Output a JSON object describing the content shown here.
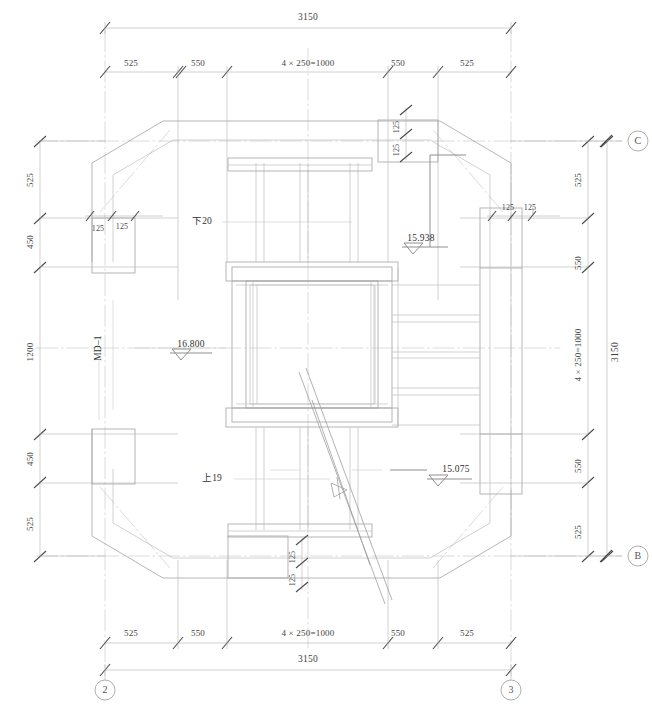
{
  "drawing": {
    "type": "structural-plan",
    "title": "",
    "units": "mm",
    "background": "#ffffff",
    "line_color": "#b9b9b9",
    "heavy_line_color": "#8f8f8f",
    "text_color": "#3b3b3b"
  },
  "grid_bubbles": [
    {
      "id": "bubble-c",
      "label": "C",
      "x": 638,
      "y": 141
    },
    {
      "id": "bubble-b",
      "label": "B",
      "x": 638,
      "y": 556
    },
    {
      "id": "bubble-2",
      "label": "2",
      "x": 105,
      "y": 690
    },
    {
      "id": "bubble-3",
      "label": "3",
      "x": 511,
      "y": 690
    }
  ],
  "dimensions": {
    "top_overall": {
      "text": "3150",
      "x": 308,
      "y": 18
    },
    "top_chain": [
      {
        "text": "525",
        "x": 131,
        "y": 63
      },
      {
        "text": "550",
        "x": 198,
        "y": 63
      },
      {
        "text": "4 × 250=1000",
        "x": 308,
        "y": 63
      },
      {
        "text": "550",
        "x": 398,
        "y": 63
      },
      {
        "text": "525",
        "x": 467,
        "y": 63
      }
    ],
    "bottom_chain": [
      {
        "text": "525",
        "x": 131,
        "y": 633
      },
      {
        "text": "550",
        "x": 198,
        "y": 633
      },
      {
        "text": "4 × 250=1000",
        "x": 308,
        "y": 633
      },
      {
        "text": "550",
        "x": 398,
        "y": 633
      },
      {
        "text": "525",
        "x": 467,
        "y": 633
      }
    ],
    "bottom_overall": {
      "text": "3150",
      "x": 308,
      "y": 660
    },
    "left_chain": [
      {
        "text": "525",
        "x": 30,
        "y": 180
      },
      {
        "text": "450",
        "x": 30,
        "y": 240
      },
      {
        "text": "1200",
        "x": 30,
        "y": 348
      },
      {
        "text": "450",
        "x": 30,
        "y": 459
      },
      {
        "text": "525",
        "x": 30,
        "y": 529
      }
    ],
    "right_chain": [
      {
        "text": "525",
        "x": 578,
        "y": 180
      },
      {
        "text": "550",
        "x": 578,
        "y": 261
      },
      {
        "text": "4 × 250=1000",
        "x": 578,
        "y": 348
      },
      {
        "text": "550",
        "x": 578,
        "y": 466
      },
      {
        "text": "525",
        "x": 578,
        "y": 535
      }
    ],
    "right_overall": {
      "text": "3150",
      "x": 615,
      "y": 348
    },
    "corner_125": [
      {
        "id": "corner-tl-a",
        "text": "125",
        "x": 98,
        "y": 228,
        "rot": false
      },
      {
        "id": "corner-tl-b",
        "text": "125",
        "x": 123,
        "y": 228,
        "rot": false
      },
      {
        "id": "corner-tr-a",
        "text": "125",
        "x": 508,
        "y": 208,
        "rot": false
      },
      {
        "id": "corner-tr-b",
        "text": "125",
        "x": 531,
        "y": 208,
        "rot": false
      },
      {
        "id": "corner-top-a",
        "text": "125",
        "x": 399,
        "y": 139,
        "rot": true
      },
      {
        "id": "corner-top-b",
        "text": "125",
        "x": 399,
        "y": 120,
        "rot": true
      },
      {
        "id": "corner-bot-a",
        "text": "125",
        "x": 294,
        "y": 571,
        "rot": true
      },
      {
        "id": "corner-bot-b",
        "text": "125",
        "x": 294,
        "y": 551,
        "rot": true
      }
    ]
  },
  "annotations": {
    "beam_tag_left": {
      "text": "MD–1",
      "x": 99,
      "y": 348
    },
    "note_down_20": {
      "text": "下20",
      "x": 200,
      "y": 222
    },
    "note_up_19": {
      "text": "上19",
      "x": 211,
      "y": 479
    }
  },
  "elevations": [
    {
      "id": "elev-16800",
      "value": "16.800",
      "x": 190,
      "y": 345,
      "dir": "left"
    },
    {
      "id": "elev-15938",
      "value": "15.938",
      "x": 420,
      "y": 239,
      "dir": "right"
    },
    {
      "id": "elev-15075",
      "value": "15.075",
      "x": 455,
      "y": 470,
      "dir": "right"
    }
  ],
  "section_mark": {
    "id": "section-cut",
    "label": "",
    "x": 338,
    "y": 489
  }
}
